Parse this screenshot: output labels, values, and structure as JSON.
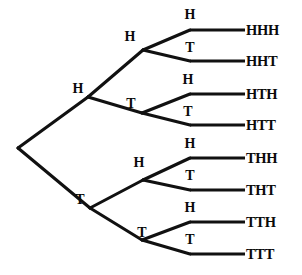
{
  "diagram": {
    "type": "tree-diagram",
    "line_color": "#111111",
    "text_color": "#0a0a0a",
    "background": "#ffffff",
    "root": {
      "x": 18,
      "y": 148
    },
    "level1": [
      {
        "id": "H",
        "label": "H",
        "x": 88,
        "y": 97,
        "label_x": 78,
        "label_y": 89
      },
      {
        "id": "T",
        "label": "T",
        "x": 90,
        "y": 208,
        "label_x": 80,
        "label_y": 200
      }
    ],
    "level2": [
      {
        "id": "HH",
        "label": "H",
        "x": 143,
        "y": 50,
        "label_x": 130,
        "label_y": 37
      },
      {
        "id": "HT",
        "label": "T",
        "x": 142,
        "y": 113,
        "label_x": 131,
        "label_y": 104
      },
      {
        "id": "TH",
        "label": "H",
        "x": 143,
        "y": 180,
        "label_x": 139,
        "label_y": 163
      },
      {
        "id": "TT",
        "label": "T",
        "x": 142,
        "y": 240,
        "label_x": 142,
        "label_y": 233
      }
    ],
    "level3": [
      {
        "id": "HHH",
        "label": "H",
        "x": 190,
        "y": 30,
        "label_x": 190,
        "label_y": 15
      },
      {
        "id": "HHT",
        "label": "T",
        "x": 190,
        "y": 61,
        "label_x": 190,
        "label_y": 48
      },
      {
        "id": "HTH",
        "label": "H",
        "x": 190,
        "y": 94,
        "label_x": 188,
        "label_y": 80
      },
      {
        "id": "HTT",
        "label": "T",
        "x": 190,
        "y": 125,
        "label_x": 188,
        "label_y": 112
      },
      {
        "id": "THH",
        "label": "H",
        "x": 190,
        "y": 158,
        "label_x": 190,
        "label_y": 144
      },
      {
        "id": "THT",
        "label": "T",
        "x": 190,
        "y": 190,
        "label_x": 190,
        "label_y": 176
      },
      {
        "id": "TTH",
        "label": "H",
        "x": 190,
        "y": 222,
        "label_x": 190,
        "label_y": 208
      },
      {
        "id": "TTT",
        "label": "T",
        "x": 190,
        "y": 254,
        "label_x": 190,
        "label_y": 240
      }
    ],
    "outcomes": [
      {
        "id": "HHH",
        "label": "HHH",
        "line_x1": 190,
        "line_x2": 245,
        "y": 30,
        "text_x": 246
      },
      {
        "id": "HHT",
        "label": "HHT",
        "line_x1": 190,
        "line_x2": 245,
        "y": 61,
        "text_x": 246
      },
      {
        "id": "HTH",
        "label": "HTH",
        "line_x1": 190,
        "line_x2": 245,
        "y": 94,
        "text_x": 246
      },
      {
        "id": "HTT",
        "label": "HTT",
        "line_x1": 190,
        "line_x2": 245,
        "y": 125,
        "text_x": 246
      },
      {
        "id": "THH",
        "label": "THH",
        "line_x1": 190,
        "line_x2": 245,
        "y": 158,
        "text_x": 246
      },
      {
        "id": "THT",
        "label": "THT",
        "line_x1": 190,
        "line_x2": 245,
        "y": 190,
        "text_x": 246
      },
      {
        "id": "TTH",
        "label": "TTH",
        "line_x1": 190,
        "line_x2": 245,
        "y": 222,
        "text_x": 246
      },
      {
        "id": "TTT",
        "label": "TTT",
        "line_x1": 190,
        "line_x2": 245,
        "y": 254,
        "text_x": 246
      }
    ]
  }
}
